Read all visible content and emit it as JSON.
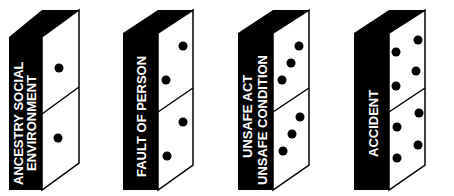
{
  "diagram": {
    "colors": {
      "side": "#000000",
      "face": "#ffffff",
      "outline": "#000000",
      "label": "#ffffff"
    },
    "dominoes": [
      {
        "label_lines": [
          "ANCESTRY SOCIAL",
          "ENVIRONMENT"
        ],
        "pips_top": 1,
        "pips_bottom": 1
      },
      {
        "label_lines": [
          "FAULT OF PERSON"
        ],
        "pips_top": 2,
        "pips_bottom": 2
      },
      {
        "label_lines": [
          "UNSAFE ACT",
          "UNSAFE CONDITION"
        ],
        "pips_top": 3,
        "pips_bottom": 3
      },
      {
        "label_lines": [
          "ACCIDENT"
        ],
        "pips_top": 4,
        "pips_bottom": 4
      }
    ]
  }
}
